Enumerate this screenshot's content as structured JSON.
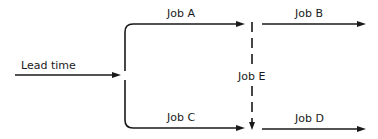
{
  "diagram": {
    "type": "flow / network schedule",
    "lead_time": {
      "label": "Lead time"
    },
    "jobs": [
      {
        "id": "A",
        "label": "Job A"
      },
      {
        "id": "B",
        "label": "Job B"
      },
      {
        "id": "C",
        "label": "Job C"
      },
      {
        "id": "D",
        "label": "Job D"
      },
      {
        "id": "E",
        "label": "Job E",
        "style": "dashed"
      }
    ],
    "edges": [
      {
        "from": "Lead time",
        "to": "split"
      },
      {
        "from": "split",
        "to": "Job A"
      },
      {
        "from": "split",
        "to": "Job C"
      },
      {
        "from": "Job A",
        "to": "Job B"
      },
      {
        "from": "Job A",
        "to": "Job E"
      },
      {
        "from": "Job E",
        "to": "Job D"
      },
      {
        "from": "Job C",
        "to": "Job D"
      }
    ],
    "colors": {
      "line": "#1a1a1a",
      "background": "#ffffff"
    }
  }
}
